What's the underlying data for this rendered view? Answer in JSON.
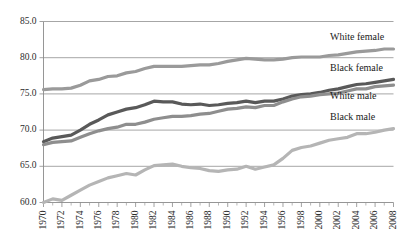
{
  "chart_data": {
    "type": "line",
    "title": "",
    "subtitle": "",
    "xlabel": "",
    "ylabel": "",
    "xlim": [
      1970,
      2008
    ],
    "ylim": [
      60.0,
      85.0
    ],
    "grid": true,
    "legend_position": "inline-right",
    "y_ticks": [
      "60.0",
      "65.0",
      "70.0",
      "75.0",
      "80.0",
      "85.0"
    ],
    "y_tick_values": [
      60.0,
      65.0,
      70.0,
      75.0,
      80.0,
      85.0
    ],
    "x_ticks": [
      "1970",
      "1972",
      "1974",
      "1976",
      "1978",
      "1980",
      "1982",
      "1984",
      "1986",
      "1988",
      "1990",
      "1992",
      "1994",
      "1996",
      "1998",
      "2000",
      "2002",
      "2004",
      "2006",
      "2008"
    ],
    "x_tick_values": [
      1970,
      1972,
      1974,
      1976,
      1978,
      1980,
      1982,
      1984,
      1986,
      1988,
      1990,
      1992,
      1994,
      1996,
      1998,
      2000,
      2002,
      2004,
      2006,
      2008
    ],
    "x_minor_step": 1,
    "x": [
      1970,
      1971,
      1972,
      1973,
      1974,
      1975,
      1976,
      1977,
      1978,
      1979,
      1980,
      1981,
      1982,
      1983,
      1984,
      1985,
      1986,
      1987,
      1988,
      1989,
      1990,
      1991,
      1992,
      1993,
      1994,
      1995,
      1996,
      1997,
      1998,
      1999,
      2000,
      2001,
      2002,
      2003,
      2004,
      2005,
      2006,
      2007,
      2008
    ],
    "series": [
      {
        "name": "White female",
        "label": "White female",
        "color": "#9a9a9a",
        "stroke_width": 3.2,
        "values": [
          75.6,
          75.7,
          75.7,
          75.8,
          76.2,
          76.8,
          77.0,
          77.4,
          77.5,
          77.9,
          78.1,
          78.5,
          78.8,
          78.8,
          78.8,
          78.8,
          78.9,
          79.0,
          79.0,
          79.2,
          79.5,
          79.7,
          79.9,
          79.8,
          79.7,
          79.7,
          79.8,
          80.0,
          80.1,
          80.1,
          80.1,
          80.3,
          80.4,
          80.6,
          80.8,
          80.9,
          81.0,
          81.2,
          81.2
        ]
      },
      {
        "name": "Black female",
        "label": "Black female",
        "color": "#595959",
        "stroke_width": 3.2,
        "values": [
          68.4,
          68.9,
          69.1,
          69.3,
          70.0,
          70.8,
          71.4,
          72.1,
          72.5,
          72.9,
          73.1,
          73.5,
          74.0,
          73.9,
          73.9,
          73.6,
          73.5,
          73.6,
          73.4,
          73.5,
          73.7,
          73.8,
          74.0,
          73.8,
          74.0,
          74.0,
          74.3,
          74.7,
          74.9,
          75.0,
          75.2,
          75.5,
          75.7,
          76.0,
          76.3,
          76.4,
          76.6,
          76.8,
          77.0
        ]
      },
      {
        "name": "White male",
        "label": "White male",
        "color": "#8e8e8e",
        "stroke_width": 3.2,
        "values": [
          68.0,
          68.3,
          68.4,
          68.5,
          69.0,
          69.5,
          69.9,
          70.2,
          70.4,
          70.8,
          70.8,
          71.1,
          71.5,
          71.7,
          71.9,
          71.9,
          72.0,
          72.2,
          72.3,
          72.6,
          72.9,
          73.0,
          73.2,
          73.1,
          73.4,
          73.4,
          73.9,
          74.3,
          74.6,
          74.7,
          74.9,
          75.0,
          75.1,
          75.4,
          75.7,
          75.7,
          76.0,
          76.1,
          76.2
        ]
      },
      {
        "name": "Black male",
        "label": "Black male",
        "color": "#b5b5b5",
        "stroke_width": 3.2,
        "values": [
          60.0,
          60.5,
          60.3,
          61.0,
          61.7,
          62.4,
          62.9,
          63.4,
          63.7,
          64.0,
          63.8,
          64.5,
          65.1,
          65.2,
          65.3,
          65.0,
          64.8,
          64.7,
          64.4,
          64.3,
          64.5,
          64.6,
          65.0,
          64.6,
          64.9,
          65.2,
          66.1,
          67.2,
          67.6,
          67.8,
          68.2,
          68.6,
          68.8,
          69.0,
          69.5,
          69.5,
          69.7,
          70.0,
          70.2
        ]
      }
    ]
  },
  "series_labels": {
    "white_female": "White female",
    "black_female": "Black female",
    "white_male": "White male",
    "black_male": "Black male"
  },
  "colors": {
    "white_female": "#9a9a9a",
    "black_female": "#595959",
    "white_male": "#8e8e8e",
    "black_male": "#b5b5b5",
    "gridline": "#7f7f7f",
    "axis": "#8a8a8a",
    "text": "#1a1a1a",
    "background": "#ffffff"
  }
}
